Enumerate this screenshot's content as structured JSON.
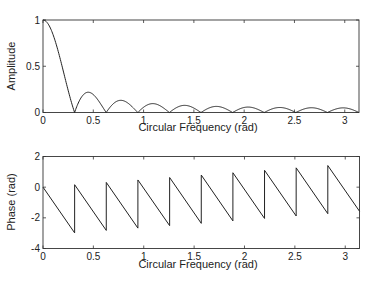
{
  "chart_data": [
    {
      "type": "line",
      "title": "",
      "xlabel": "Circular Frequency (rad)",
      "ylabel": "Amplitude",
      "xlim": [
        0,
        3.1416
      ],
      "ylim": [
        0,
        1
      ],
      "xticks": [
        0,
        0.5,
        1,
        1.5,
        2,
        2.5,
        3
      ],
      "xtick_labels": [
        "0",
        "0.5",
        "1",
        "1.5",
        "2",
        "2.5",
        "3"
      ],
      "yticks": [
        0,
        0.5,
        1
      ],
      "ytick_labels": [
        "0",
        "0.5",
        "1"
      ],
      "grid": false,
      "legend": null,
      "description": "Magnitude response |sin(10w)/(20 sin(w/2))| of a 20-point rectangular window; zeros at multiples of pi/10",
      "series": [
        {
          "name": "Amplitude",
          "x": [
            0,
            0.1,
            0.2,
            0.314,
            0.47,
            0.628,
            0.785,
            0.942,
            1.1,
            1.257,
            1.41,
            1.571,
            1.73,
            1.885,
            2.04,
            2.199,
            2.36,
            2.513,
            2.67,
            2.827,
            2.98,
            3.1416
          ],
          "values": [
            1,
            0.84,
            0.45,
            0,
            0.21,
            0,
            0.13,
            0,
            0.095,
            0,
            0.075,
            0,
            0.065,
            0,
            0.058,
            0,
            0.054,
            0,
            0.051,
            0,
            0.05,
            0
          ]
        }
      ]
    },
    {
      "type": "line",
      "title": "",
      "xlabel": "Circular Frequency (rad)",
      "ylabel": "Phase (rad)",
      "xlim": [
        0,
        3.1416
      ],
      "ylim": [
        -4,
        2
      ],
      "xticks": [
        0,
        0.5,
        1,
        1.5,
        2,
        2.5,
        3
      ],
      "xtick_labels": [
        "0",
        "0.5",
        "1",
        "1.5",
        "2",
        "2.5",
        "3"
      ],
      "yticks": [
        -4,
        -2,
        0,
        2
      ],
      "ytick_labels": [
        "-4",
        "-2",
        "0",
        "2"
      ],
      "grid": false,
      "legend": null,
      "description": "Linear phase -9.5w with +pi jumps at each zero of amplitude (k*pi/10)",
      "series": [
        {
          "name": "Phase",
          "x": [
            0,
            0.314,
            0.314,
            0.628,
            0.628,
            0.942,
            0.942,
            1.257,
            1.257,
            1.571,
            1.571,
            1.885,
            1.885,
            2.199,
            2.199,
            2.513,
            2.513,
            2.827,
            2.827,
            3.1416
          ],
          "values": [
            0,
            -2.98,
            0.16,
            -2.82,
            0.31,
            -2.67,
            0.47,
            -2.51,
            0.63,
            -2.36,
            0.79,
            -2.2,
            0.94,
            -2.04,
            1.1,
            -1.88,
            1.26,
            -1.73,
            1.41,
            -1.57
          ]
        }
      ]
    }
  ],
  "plots": {
    "top": {
      "ylabel": "Amplitude",
      "xlabel": "Circular Frequency (rad)",
      "yticks": [
        "0",
        "0.5",
        "1"
      ],
      "xticks": [
        "0",
        "0.5",
        "1",
        "1.5",
        "2",
        "2.5",
        "3"
      ]
    },
    "bottom": {
      "ylabel": "Phase (rad)",
      "xlabel": "Circular Frequency (rad)",
      "yticks": [
        "2",
        "0",
        "-2",
        "-4"
      ],
      "xticks": [
        "0",
        "0.5",
        "1",
        "1.5",
        "2",
        "2.5",
        "3"
      ]
    }
  }
}
